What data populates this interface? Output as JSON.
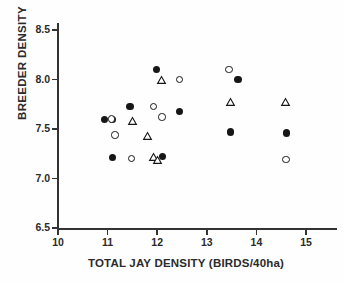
{
  "chart_data": {
    "type": "scatter",
    "title": "",
    "xlabel": "TOTAL JAY DENSITY (BIRDS/40ha)",
    "ylabel": "BREEDER DENSITY",
    "xlim": [
      10,
      15.6
    ],
    "ylim": [
      6.5,
      8.65
    ],
    "xticks": [
      10,
      11,
      12,
      13,
      14,
      15
    ],
    "xtick_labels": [
      "10",
      "11",
      "12",
      "13",
      "14",
      "15"
    ],
    "yticks": [
      6.5,
      7.0,
      7.5,
      8.0,
      8.5
    ],
    "ytick_labels": [
      "6.5",
      "7.0",
      "7.5",
      "8.0",
      "8.5"
    ],
    "grid": false,
    "legend": "none",
    "marker_color": "#161616",
    "series": [
      {
        "name": "filled-circle",
        "marker": "filled-circle",
        "points": [
          {
            "x": 10.93,
            "y": 7.6
          },
          {
            "x": 11.1,
            "y": 7.6
          },
          {
            "x": 11.1,
            "y": 7.21
          },
          {
            "x": 11.45,
            "y": 7.73
          },
          {
            "x": 11.98,
            "y": 8.1
          },
          {
            "x": 12.1,
            "y": 7.22
          },
          {
            "x": 12.45,
            "y": 7.68
          },
          {
            "x": 13.48,
            "y": 7.47
          },
          {
            "x": 13.63,
            "y": 8.0
          },
          {
            "x": 14.6,
            "y": 7.46
          }
        ]
      },
      {
        "name": "open-circle",
        "marker": "open-circle",
        "points": [
          {
            "x": 11.08,
            "y": 7.6
          },
          {
            "x": 11.15,
            "y": 7.44
          },
          {
            "x": 11.48,
            "y": 7.2
          },
          {
            "x": 11.93,
            "y": 7.73
          },
          {
            "x": 12.1,
            "y": 7.62
          },
          {
            "x": 12.45,
            "y": 8.0
          },
          {
            "x": 13.45,
            "y": 8.1
          },
          {
            "x": 14.6,
            "y": 7.19
          }
        ]
      },
      {
        "name": "open-triangle",
        "marker": "open-triangle",
        "points": [
          {
            "x": 11.5,
            "y": 7.58
          },
          {
            "x": 11.8,
            "y": 7.43
          },
          {
            "x": 11.92,
            "y": 7.22
          },
          {
            "x": 12.0,
            "y": 7.19
          },
          {
            "x": 12.08,
            "y": 8.0
          },
          {
            "x": 13.48,
            "y": 7.77
          },
          {
            "x": 14.58,
            "y": 7.77
          }
        ]
      }
    ]
  },
  "axes": {
    "x_title": "TOTAL JAY DENSITY (BIRDS/40ha)",
    "y_title": "BREEDER DENSITY"
  }
}
